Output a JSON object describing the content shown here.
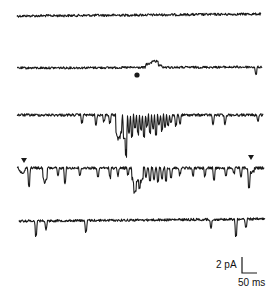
{
  "chart_data": {
    "type": "line",
    "title": "",
    "xlabel": "",
    "ylabel": "",
    "grid": false,
    "legend": null,
    "traces": [
      {
        "name": "trace-1",
        "baseline_y": 16,
        "x_start": 17,
        "x_end": 261,
        "noise": 1.2,
        "drift": -2,
        "events": []
      },
      {
        "name": "trace-2",
        "baseline_y": 68,
        "x_start": 17,
        "x_end": 262,
        "noise": 1.1,
        "drift": -1,
        "events": [
          {
            "x": 152,
            "depth": -5,
            "width": 6
          },
          {
            "x": 157,
            "depth": -3,
            "width": 5
          },
          {
            "x": 256,
            "depth": 8,
            "width": 1
          }
        ]
      },
      {
        "name": "trace-3",
        "baseline_y": 115,
        "x_start": 17,
        "x_end": 263,
        "noise": 1.3,
        "drift": 0,
        "events": [
          {
            "x": 82,
            "depth": 8,
            "width": 1
          },
          {
            "x": 96,
            "depth": 10,
            "width": 1
          },
          {
            "x": 104,
            "depth": 7,
            "width": 1
          },
          {
            "x": 110,
            "depth": 9,
            "width": 1
          },
          {
            "x": 118,
            "depth": 28,
            "width": 2
          },
          {
            "x": 121,
            "depth": 20,
            "width": 1
          },
          {
            "x": 124,
            "depth": 25,
            "width": 1
          },
          {
            "x": 126,
            "depth": 42,
            "width": 1
          },
          {
            "x": 129,
            "depth": 18,
            "width": 1
          },
          {
            "x": 132,
            "depth": 22,
            "width": 1
          },
          {
            "x": 135,
            "depth": 14,
            "width": 1
          },
          {
            "x": 138,
            "depth": 20,
            "width": 1
          },
          {
            "x": 141,
            "depth": 16,
            "width": 1
          },
          {
            "x": 144,
            "depth": 24,
            "width": 1
          },
          {
            "x": 147,
            "depth": 12,
            "width": 1
          },
          {
            "x": 150,
            "depth": 18,
            "width": 1
          },
          {
            "x": 153,
            "depth": 14,
            "width": 1
          },
          {
            "x": 156,
            "depth": 20,
            "width": 1
          },
          {
            "x": 159,
            "depth": 10,
            "width": 1
          },
          {
            "x": 162,
            "depth": 16,
            "width": 1
          },
          {
            "x": 165,
            "depth": 12,
            "width": 1
          },
          {
            "x": 168,
            "depth": 10,
            "width": 1
          },
          {
            "x": 171,
            "depth": 8,
            "width": 1
          },
          {
            "x": 176,
            "depth": 12,
            "width": 1
          },
          {
            "x": 180,
            "depth": 9,
            "width": 1
          },
          {
            "x": 213,
            "depth": 10,
            "width": 1
          },
          {
            "x": 225,
            "depth": 9,
            "width": 1
          },
          {
            "x": 258,
            "depth": 7,
            "width": 1
          }
        ]
      },
      {
        "name": "trace-4",
        "baseline_y": 168,
        "x_start": 17,
        "x_end": 264,
        "noise": 1.3,
        "drift": 0,
        "events": [
          {
            "x": 22,
            "depth": 5,
            "width": 3
          },
          {
            "x": 29,
            "depth": 19,
            "width": 1
          },
          {
            "x": 45,
            "depth": 16,
            "width": 2
          },
          {
            "x": 58,
            "depth": 8,
            "width": 1
          },
          {
            "x": 65,
            "depth": 15,
            "width": 1
          },
          {
            "x": 80,
            "depth": 8,
            "width": 1
          },
          {
            "x": 98,
            "depth": 10,
            "width": 1
          },
          {
            "x": 110,
            "depth": 10,
            "width": 1
          },
          {
            "x": 118,
            "depth": 8,
            "width": 1
          },
          {
            "x": 128,
            "depth": 7,
            "width": 1
          },
          {
            "x": 134,
            "depth": 16,
            "width": 2
          },
          {
            "x": 137,
            "depth": 15,
            "width": 3
          },
          {
            "x": 141,
            "depth": 16,
            "width": 2
          },
          {
            "x": 146,
            "depth": 10,
            "width": 1
          },
          {
            "x": 150,
            "depth": 14,
            "width": 1
          },
          {
            "x": 154,
            "depth": 12,
            "width": 1
          },
          {
            "x": 158,
            "depth": 14,
            "width": 1
          },
          {
            "x": 162,
            "depth": 12,
            "width": 1
          },
          {
            "x": 166,
            "depth": 14,
            "width": 1
          },
          {
            "x": 171,
            "depth": 10,
            "width": 1
          },
          {
            "x": 180,
            "depth": 7,
            "width": 1
          },
          {
            "x": 193,
            "depth": 8,
            "width": 1
          },
          {
            "x": 205,
            "depth": 8,
            "width": 1
          },
          {
            "x": 214,
            "depth": 12,
            "width": 1
          },
          {
            "x": 226,
            "depth": 9,
            "width": 1
          },
          {
            "x": 234,
            "depth": 6,
            "width": 1
          },
          {
            "x": 241,
            "depth": 8,
            "width": 1
          },
          {
            "x": 249,
            "depth": 16,
            "width": 1
          },
          {
            "x": 251,
            "depth": 5,
            "width": 3
          }
        ]
      },
      {
        "name": "trace-5",
        "baseline_y": 221,
        "x_start": 19,
        "x_end": 265,
        "noise": 1.2,
        "drift": -2,
        "events": [
          {
            "x": 36,
            "depth": 16,
            "width": 1
          },
          {
            "x": 46,
            "depth": 9,
            "width": 1
          },
          {
            "x": 86,
            "depth": 13,
            "width": 1
          },
          {
            "x": 211,
            "depth": 9,
            "width": 1
          },
          {
            "x": 236,
            "depth": 17,
            "width": 1
          },
          {
            "x": 246,
            "depth": 9,
            "width": 1
          }
        ]
      }
    ],
    "markers": [
      {
        "type": "dot",
        "name": "event-dot",
        "x": 137,
        "y": 75
      },
      {
        "type": "triangle-down",
        "name": "start-arrowhead",
        "x": 24,
        "y": 161
      },
      {
        "type": "triangle-down",
        "name": "end-arrowhead",
        "x": 251,
        "y": 158
      }
    ],
    "scale_bar": {
      "vertical_label": "2 pA",
      "horizontal_label": "50 ms",
      "x": 242,
      "y_top": 257,
      "y_bottom": 273,
      "x_end": 257
    }
  },
  "colors": {
    "trace": "#1a1a1a",
    "background": "#ffffff"
  }
}
